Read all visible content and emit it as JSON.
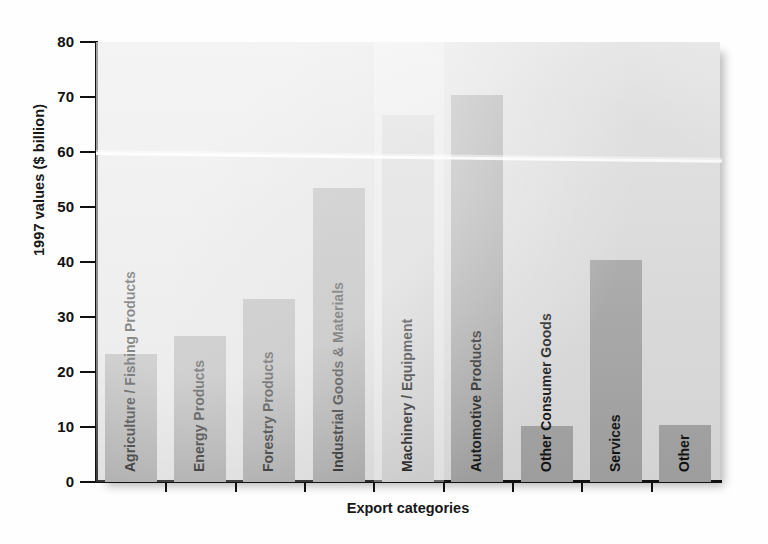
{
  "chart_data": {
    "type": "bar",
    "title": "",
    "xlabel": "Export categories",
    "ylabel": "1997 values ($ billion)",
    "ylim": [
      0,
      80
    ],
    "yticks": [
      0,
      10,
      20,
      30,
      40,
      50,
      60,
      70,
      80
    ],
    "ytick_labels": [
      "0",
      "10",
      "20",
      "30",
      "40",
      "50",
      "60",
      "70",
      "80"
    ],
    "grid": false,
    "legend": "none",
    "bar_color": "#a8a8a8",
    "faded_bar_color": "#d6d6d6",
    "plot_background": "#e2e2e2",
    "categories": [
      "Agriculture / Fishing Products",
      "Energy Products",
      "Forestry Products",
      "Industrial Goods & Materials",
      "Machinery / Equipment",
      "Automotive Products",
      "Other Consumer Goods",
      "Services",
      "Other"
    ],
    "values": [
      23.2,
      26.5,
      33.2,
      53.5,
      66.8,
      70.3,
      10.2,
      40.4,
      10.4
    ]
  },
  "axes": {
    "y_title": "1997 values ($ billion)",
    "x_title": "Export categories"
  }
}
